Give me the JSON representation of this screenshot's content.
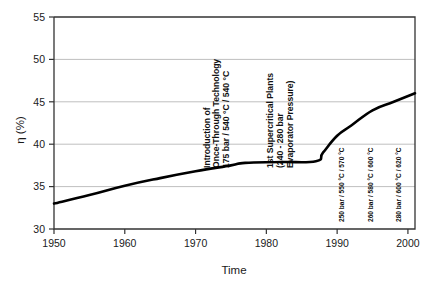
{
  "chart_data": {
    "type": "line",
    "title": "",
    "xlabel": "Time",
    "ylabel": "η (%)",
    "xlim": [
      1950,
      2001
    ],
    "ylim": [
      30,
      55
    ],
    "grid": true,
    "legend": "none",
    "x_ticks": [
      "1950",
      "1960",
      "1970",
      "1980",
      "1990",
      "2000"
    ],
    "x_tick_values": [
      1950,
      1960,
      1970,
      1980,
      1990,
      2000
    ],
    "y_ticks": [
      "30",
      "35",
      "40",
      "45",
      "50",
      "55"
    ],
    "y_tick_values": [
      30,
      35,
      40,
      45,
      50,
      55
    ],
    "series": [
      {
        "name": "Net efficiency",
        "x": [
          1950,
          1955,
          1960,
          1965,
          1970,
          1975,
          1977,
          1982,
          1987,
          1988,
          1990,
          1992,
          1995,
          1998,
          2001
        ],
        "values": [
          33.0,
          34.0,
          35.1,
          36.0,
          36.8,
          37.5,
          37.8,
          37.9,
          38.0,
          39.0,
          41.0,
          42.2,
          44.0,
          45.0,
          46.0
        ]
      }
    ],
    "annotations": [
      {
        "id": "once-through",
        "x_value": 1972,
        "lines": [
          "Introduction of",
          "Once-Through Technology",
          "175 bar / 540 °C / 540 °C"
        ],
        "rotation": -90,
        "size": "major"
      },
      {
        "id": "supercritical",
        "x_value": 1981,
        "lines": [
          "1st Supercritical Plants",
          "(240 - 280 bar",
          "Evaporator Pressure)"
        ],
        "rotation": -90,
        "size": "major"
      },
      {
        "id": "plant-250bar",
        "x_value": 1991,
        "lines": [
          "250 bar / 550 °C / 570 °C"
        ],
        "rotation": -90,
        "size": "minor"
      },
      {
        "id": "plant-260bar",
        "x_value": 1995,
        "lines": [
          "260 bar / 580 °C / 600 °C"
        ],
        "rotation": -90,
        "size": "minor"
      },
      {
        "id": "plant-280bar",
        "x_value": 1999,
        "lines": [
          "280 bar / 600 °C / 620 °C"
        ],
        "rotation": -90,
        "size": "minor"
      }
    ],
    "colors": {
      "curve": "#000000",
      "gridline": "#bfbfbf",
      "axis": "#333333",
      "background": "#ffffff"
    }
  }
}
